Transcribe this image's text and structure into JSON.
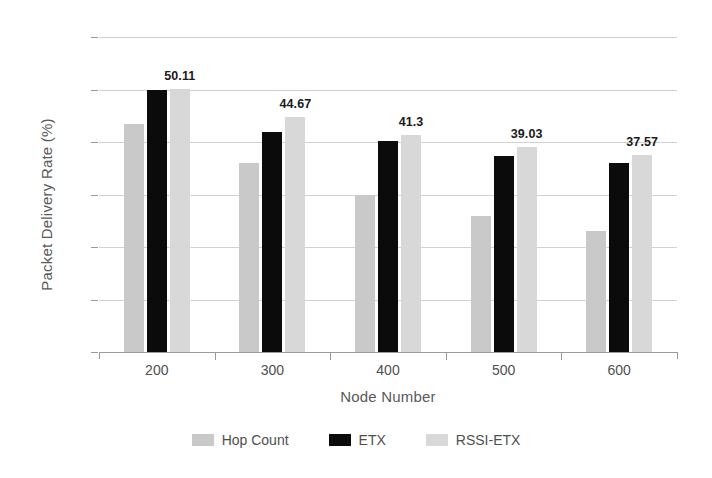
{
  "chart_data": {
    "type": "bar",
    "title": "",
    "xlabel": "Node Number",
    "ylabel": "Packet Delivery Rate (%)",
    "categories": [
      "200",
      "300",
      "400",
      "500",
      "600"
    ],
    "ylim": [
      0,
      60
    ],
    "yticks": [
      0,
      10,
      20,
      30,
      40,
      50,
      60
    ],
    "ytick_labels": [
      "0",
      "10",
      "20",
      "30",
      "40",
      "50",
      "60"
    ],
    "grid": true,
    "legend_position": "bottom",
    "series": [
      {
        "name": "Hop Count",
        "color": "#c9c9c9",
        "values": [
          43.5,
          36.0,
          30.0,
          26.0,
          23.0
        ]
      },
      {
        "name": "ETX",
        "color": "#0b0b0b",
        "values": [
          50.0,
          42.0,
          40.2,
          37.3,
          36.0
        ]
      },
      {
        "name": "RSSI-ETX",
        "color": "#d8d8d8",
        "values": [
          50.11,
          44.67,
          41.3,
          39.03,
          37.57
        ]
      }
    ],
    "data_labels": [
      "50.11",
      "44.67",
      "41.3",
      "39.03",
      "37.57"
    ],
    "data_labels_series": "RSSI-ETX"
  }
}
